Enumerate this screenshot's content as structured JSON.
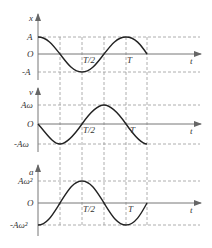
{
  "figure": {
    "graphs": [
      {
        "id": "displacement",
        "y_label": "x",
        "x_label": "t",
        "top_label": "A",
        "origin_label": "O",
        "bottom_label": "-A",
        "tick_half": "T/2",
        "tick_full": "T",
        "function": "A cos(ωt)"
      },
      {
        "id": "velocity",
        "y_label": "v",
        "x_label": "t",
        "top_label": "Aω",
        "origin_label": "O",
        "bottom_label": "-Aω",
        "tick_half": "T/2",
        "tick_full": "T",
        "function": "-Aω sin(ωt)"
      },
      {
        "id": "acceleration",
        "y_label": "a",
        "x_label": "t",
        "top_label": "Aω²",
        "origin_label": "O",
        "bottom_label": "-Aω²",
        "tick_half": "T/2",
        "tick_full": "T",
        "function": "-Aω² cos(ωt)"
      }
    ]
  }
}
